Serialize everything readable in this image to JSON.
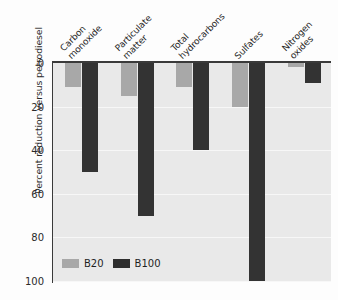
{
  "chart_data": {
    "type": "bar",
    "title": "",
    "subtitle": "",
    "xlabel": "",
    "ylabel": "Percent reduction versus petrodiesel",
    "categories": [
      "Carbon\nmonoxide",
      "Particulate\nmatter",
      "Total\nhydrocarbons",
      "Sulfates",
      "Nitrogen\noxides"
    ],
    "series": [
      {
        "name": "B20",
        "values": [
          11,
          15,
          11,
          20,
          2
        ],
        "color": "#a8a8a8"
      },
      {
        "name": "B100",
        "values": [
          50,
          70,
          40,
          100,
          9
        ],
        "color": "#333333"
      }
    ],
    "ylim": [
      0,
      100
    ],
    "y_inverted": true,
    "yticks": [
      0,
      20,
      40,
      60,
      80,
      100
    ],
    "ytick_labels": [
      "0",
      "20",
      "40",
      "60",
      "80",
      "100"
    ],
    "grid": true,
    "legend_position": "bottom-left",
    "annotations": []
  },
  "legend": {
    "entries": [
      {
        "label": "B20"
      },
      {
        "label": "B100"
      }
    ]
  },
  "colors": {
    "b20": "#a8a8a8",
    "b100": "#333333",
    "plot_background": "#e9e9e9",
    "axis": "#3a3a3a",
    "gridline": "#f7f7f7",
    "text": "#262626"
  }
}
